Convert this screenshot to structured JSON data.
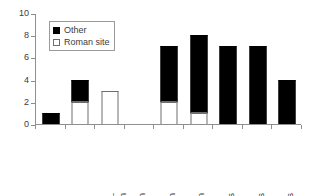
{
  "chart_data": {
    "type": "bar",
    "title": "",
    "xlabel": "",
    "ylabel": "",
    "ylim": [
      0,
      10
    ],
    "yticks": [
      0,
      2,
      4,
      6,
      8,
      10
    ],
    "grid": false,
    "stacked": true,
    "legend_position": "upper-left-inside",
    "categories": [
      "Pre-\nFlavian",
      "Flavian",
      "Trajan",
      "Hadrian",
      "A Pius",
      "M Aurelius",
      "Commodus",
      "Severan",
      "Post-217"
    ],
    "series": [
      {
        "name": "Roman site",
        "color": "#ffffff",
        "values": [
          0,
          2,
          3,
          0,
          2,
          1,
          0,
          0,
          0
        ]
      },
      {
        "name": "Other",
        "color": "#000000",
        "values": [
          1,
          2,
          0,
          0,
          5,
          7,
          7,
          7,
          4
        ]
      }
    ],
    "totals": [
      1,
      4,
      3,
      0,
      7,
      8,
      7,
      7,
      4
    ]
  },
  "legend": {
    "items": [
      {
        "label": "Other",
        "swatch": "filled-black"
      },
      {
        "label": "Roman site",
        "swatch": "open-white"
      }
    ]
  }
}
